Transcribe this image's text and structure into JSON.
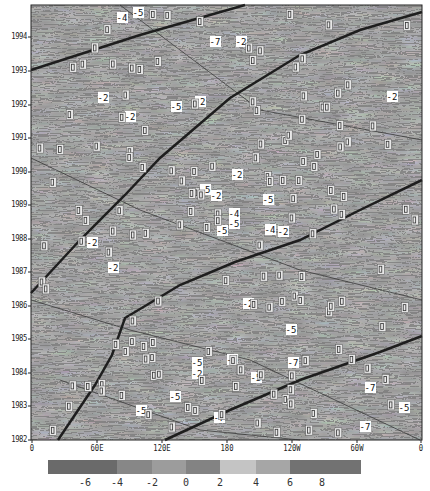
{
  "chart_data": {
    "type": "heatmap",
    "subtype": "hovmoller-contour",
    "title": "",
    "xlabel": "Longitude",
    "ylabel": "Year",
    "x_ticks": [
      "0",
      "60E",
      "120E",
      "180",
      "120W",
      "60W",
      "0"
    ],
    "y_ticks": [
      "1982",
      "1983",
      "1984",
      "1985",
      "1986",
      "1987",
      "1988",
      "1989",
      "1990",
      "1991",
      "1992",
      "1993",
      "1994"
    ],
    "ylim": [
      1982,
      1994.7
    ],
    "xlim": [
      0,
      360
    ],
    "colorbar": {
      "orientation": "horizontal",
      "levels": [
        "-6",
        "-4",
        "-2",
        "0",
        "2",
        "4",
        "6",
        "8"
      ],
      "colors": [
        "#6a6a6a",
        "#878787",
        "#9c9c9c",
        "#838383",
        "#c4c4c4",
        "#a6a6a6",
        "#727272"
      ]
    },
    "contour_labels": [
      "0",
      "-2",
      "-4",
      "-5",
      "-7"
    ],
    "annotations": "Thick diagonal lines indicate eastward-propagating features; contour labels mostly 0 with negative values -2, -4, -5, -7",
    "grid": false,
    "legend_position": "bottom"
  },
  "axes": {
    "y": [
      {
        "label": "1994",
        "y": 37
      },
      {
        "label": "1993",
        "y": 71
      },
      {
        "label": "1992",
        "y": 105
      },
      {
        "label": "1991",
        "y": 138
      },
      {
        "label": "1990",
        "y": 172
      },
      {
        "label": "1989",
        "y": 205
      },
      {
        "label": "1988",
        "y": 239
      },
      {
        "label": "1987",
        "y": 272
      },
      {
        "label": "1986",
        "y": 306
      },
      {
        "label": "1985",
        "y": 339
      },
      {
        "label": "1984",
        "y": 373
      },
      {
        "label": "1983",
        "y": 406
      },
      {
        "label": "1982",
        "y": 440
      }
    ],
    "x": [
      {
        "label": "0",
        "x": 32
      },
      {
        "label": "60E",
        "x": 97
      },
      {
        "label": "120E",
        "x": 162
      },
      {
        "label": "180",
        "x": 227
      },
      {
        "label": "120W",
        "x": 292
      },
      {
        "label": "60W",
        "x": 357
      },
      {
        "label": "0",
        "x": 421
      }
    ]
  },
  "colorbar_labels": [
    {
      "label": "-6",
      "x": 85
    },
    {
      "label": "-4",
      "x": 117
    },
    {
      "label": "-2",
      "x": 152
    },
    {
      "label": "0",
      "x": 186
    },
    {
      "label": "2",
      "x": 220
    },
    {
      "label": "4",
      "x": 256
    },
    {
      "label": "6",
      "x": 290
    },
    {
      "label": "8",
      "x": 322
    }
  ],
  "labels": [
    {
      "t": "-4",
      "x": 122,
      "y": 18
    },
    {
      "t": "-5",
      "x": 138,
      "y": 13
    },
    {
      "t": "-7",
      "x": 215,
      "y": 42
    },
    {
      "t": "-2",
      "x": 241,
      "y": 42
    },
    {
      "t": "-2",
      "x": 103,
      "y": 98
    },
    {
      "t": "-5",
      "x": 176,
      "y": 107
    },
    {
      "t": "-2",
      "x": 200,
      "y": 102
    },
    {
      "t": "-2",
      "x": 392,
      "y": 97
    },
    {
      "t": "-2",
      "x": 130,
      "y": 117
    },
    {
      "t": "-2",
      "x": 237,
      "y": 175
    },
    {
      "t": "-5",
      "x": 205,
      "y": 190
    },
    {
      "t": "-2",
      "x": 216,
      "y": 196
    },
    {
      "t": "-5",
      "x": 268,
      "y": 200
    },
    {
      "t": "-4",
      "x": 234,
      "y": 214
    },
    {
      "t": "-5",
      "x": 234,
      "y": 224
    },
    {
      "t": "-5",
      "x": 222,
      "y": 231
    },
    {
      "t": "-4",
      "x": 270,
      "y": 230
    },
    {
      "t": "-2",
      "x": 283,
      "y": 232
    },
    {
      "t": "-2",
      "x": 248,
      "y": 304
    },
    {
      "t": "-2",
      "x": 92,
      "y": 243
    },
    {
      "t": "-2",
      "x": 113,
      "y": 268
    },
    {
      "t": "-5",
      "x": 197,
      "y": 363
    },
    {
      "t": "-2",
      "x": 197,
      "y": 374
    },
    {
      "t": "-5",
      "x": 232,
      "y": 360
    },
    {
      "t": "-5",
      "x": 175,
      "y": 397
    },
    {
      "t": "-5",
      "x": 141,
      "y": 411
    },
    {
      "t": "-7",
      "x": 293,
      "y": 363
    },
    {
      "t": "-5",
      "x": 291,
      "y": 330
    },
    {
      "t": "-7",
      "x": 370,
      "y": 388
    },
    {
      "t": "-5",
      "x": 404,
      "y": 408
    },
    {
      "t": "-7",
      "x": 365,
      "y": 427
    },
    {
      "t": "-5",
      "x": 256,
      "y": 378
    },
    {
      "t": "-7",
      "x": 219,
      "y": 418
    }
  ]
}
